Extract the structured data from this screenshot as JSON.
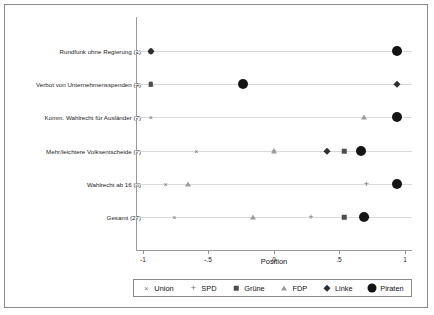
{
  "chart_data": {
    "type": "scatter",
    "title": "",
    "xlabel": "Position",
    "ylabel": "",
    "xlim": [
      -1.12,
      1.12
    ],
    "xticks": [
      -1,
      -0.5,
      0,
      0.5,
      1
    ],
    "xtick_labels": [
      "-1",
      "-.5",
      "0",
      ".5",
      "1"
    ],
    "grid": true,
    "legend_position": "bottom",
    "categories": [
      "Rundfunk ohne Regierung (1)",
      "Verbot von Unternehmensspenden (4)",
      "Komm. Wahlrecht für Ausländer (7)",
      "Mehr/leichtere Volksentscheide (7)",
      "Wahlrecht ab 16 (8)",
      "Gesamt (27)"
    ],
    "series": [
      {
        "name": "Union",
        "marker": "x",
        "color": "#6e6e6e",
        "values": [
          -1.0,
          -1.0,
          -1.0,
          -0.63,
          -0.88,
          -0.81
        ]
      },
      {
        "name": "SPD",
        "marker": "plus",
        "color": "#707070",
        "values": [
          -1.0,
          -1.0,
          1.0,
          0.0,
          0.75,
          0.3
        ]
      },
      {
        "name": "Grüne",
        "marker": "square",
        "color": "#4d4d4d",
        "values": [
          -1.0,
          -1.0,
          1.0,
          0.57,
          1.0,
          0.57
        ]
      },
      {
        "name": "FDP",
        "marker": "triangle",
        "color": "#9c9c9c",
        "values": [
          -1.0,
          -1.0,
          0.73,
          0.0,
          -0.7,
          -0.17
        ]
      },
      {
        "name": "Linke",
        "marker": "diamond",
        "color": "#2e2e2e",
        "values": [
          -1.0,
          1.0,
          1.0,
          0.43,
          1.0,
          0.75
        ]
      },
      {
        "name": "Piraten",
        "marker": "circle",
        "color": "#151515",
        "values": [
          1.0,
          -0.25,
          1.0,
          0.71,
          1.0,
          0.73
        ]
      }
    ]
  },
  "legend": {
    "entries": [
      {
        "label": "Union",
        "glyph": "x-marker-icon"
      },
      {
        "label": "SPD",
        "glyph": "plus-marker-icon"
      },
      {
        "label": "Grüne",
        "glyph": "square-marker-icon"
      },
      {
        "label": "FDP",
        "glyph": "triangle-marker-icon"
      },
      {
        "label": "Linke",
        "glyph": "diamond-marker-icon"
      },
      {
        "label": "Piraten",
        "glyph": "circle-marker-icon"
      }
    ]
  }
}
